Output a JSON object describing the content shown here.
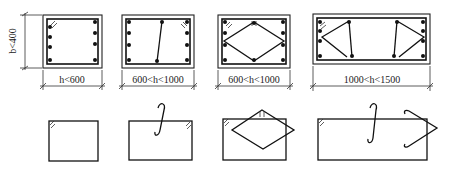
{
  "diagram": {
    "width_label": "b<400",
    "sections": [
      {
        "id": "s1",
        "label": "h<600",
        "stirrup_type": "single closed stirrup"
      },
      {
        "id": "s2",
        "label": "600<h<1000",
        "stirrup_type": "closed stirrup with single-leg hook tie"
      },
      {
        "id": "s3",
        "label": "600<h<1000",
        "stirrup_type": "closed stirrup with diamond stirrup"
      },
      {
        "id": "s4",
        "label": "1000<h<1500",
        "stirrup_type": "closed stirrup with hook tie and bent-up stirrup"
      }
    ],
    "bottom_row": [
      {
        "id": "d1",
        "description": "closed rectangular stirrup with 135° hook"
      },
      {
        "id": "d2",
        "description": "closed stirrup + S-shaped single leg tie"
      },
      {
        "id": "d3",
        "description": "closed stirrup + diamond stirrup"
      },
      {
        "id": "d4",
        "description": "closed stirrup + S-hook tie + open V stirrup"
      }
    ],
    "colors": {
      "line": "#111111",
      "background": "#ffffff"
    }
  }
}
